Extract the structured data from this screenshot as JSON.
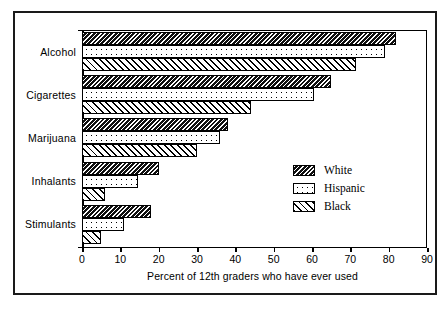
{
  "chart_data": {
    "type": "bar",
    "orientation": "horizontal",
    "title": "",
    "xlabel": "Percent of 12th graders who have ever used",
    "ylabel": "",
    "xlim": [
      0,
      90
    ],
    "xticks": [
      0,
      10,
      20,
      30,
      40,
      50,
      60,
      70,
      80,
      90
    ],
    "grid": false,
    "legend_position": "center-right",
    "categories": [
      "Alcohol",
      "Cigarettes",
      "Marijuana",
      "Inhalants",
      "Stimulants"
    ],
    "series": [
      {
        "name": "White",
        "pattern": "dense-backslash-hatch",
        "values": [
          82,
          65,
          38,
          20,
          18
        ]
      },
      {
        "name": "Hispanic",
        "pattern": "dotted",
        "values": [
          79,
          60.5,
          36,
          14.5,
          11
        ]
      },
      {
        "name": "Black",
        "pattern": "sparse-slash-hatch",
        "values": [
          71.5,
          44,
          30,
          6,
          5
        ]
      }
    ]
  },
  "legend": {
    "items": [
      {
        "label": "White"
      },
      {
        "label": "Hispanic"
      },
      {
        "label": "Black"
      }
    ]
  },
  "colors": {
    "ink": "#000000",
    "background": "#ffffff",
    "white_series_fill": "#101010"
  }
}
